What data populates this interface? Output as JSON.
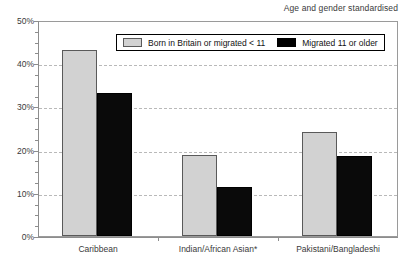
{
  "chart_data": {
    "type": "bar",
    "title": "Age and gender standardised",
    "xlabel": "",
    "ylabel": "",
    "ylim": [
      0,
      50
    ],
    "ytick_values": [
      0,
      10,
      20,
      30,
      40,
      50
    ],
    "ytick_labels": [
      "0%",
      "10%",
      "20%",
      "30%",
      "40%",
      "50%"
    ],
    "yminor_step": 2.5,
    "grid": "horizontal-dashed at 10,20,30,40",
    "legend_position": "inside-top-center",
    "categories": [
      "Caribbean",
      "Indian/African Asian*",
      "Pakistani/Bangladeshi"
    ],
    "series": [
      {
        "name": "Born in Britain or migrated < 11",
        "color": "#d2d2d2",
        "values": [
          43.0,
          18.7,
          24.0
        ]
      },
      {
        "name": "Migrated 11 or older",
        "color": "#000000",
        "values": [
          33.0,
          11.4,
          18.5
        ]
      }
    ],
    "annotations": [
      "* denotes Indian/African Asian category footnote marker"
    ]
  },
  "legend": {
    "items": [
      {
        "label": "Born in Britain or migrated < 11",
        "swatch": "light"
      },
      {
        "label": "Migrated 11 or older",
        "swatch": "dark"
      }
    ]
  },
  "axes": {
    "y_labels": [
      "50%",
      "40%",
      "30%",
      "20%",
      "10%",
      "0%"
    ],
    "x_labels": [
      "Caribbean",
      "Indian/African Asian*",
      "Pakistani/Bangladeshi"
    ]
  }
}
